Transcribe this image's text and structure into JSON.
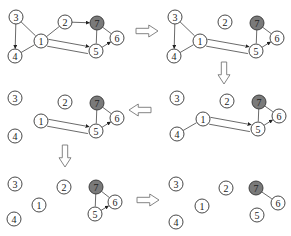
{
  "figure": {
    "node_radius": 7,
    "dark_node_color": "#7a7a7a",
    "panels": [
      {
        "id": "panel-1",
        "nodes": [
          {
            "id": "3",
            "x": 16,
            "y": 17
          },
          {
            "id": "4",
            "x": 15,
            "y": 56
          },
          {
            "id": "1",
            "x": 41,
            "y": 41
          },
          {
            "id": "2",
            "x": 65,
            "y": 22
          },
          {
            "id": "7",
            "x": 97,
            "y": 23,
            "dark": true
          },
          {
            "id": "5",
            "x": 96,
            "y": 51
          },
          {
            "id": "6",
            "x": 117,
            "y": 38
          }
        ],
        "edges": [
          {
            "from": "3",
            "to": "4",
            "arrow": true
          },
          {
            "from": "3",
            "to": "1"
          },
          {
            "from": "4",
            "to": "1"
          },
          {
            "from": "1",
            "to": "2"
          },
          {
            "from": "2",
            "to": "7",
            "arrow": true
          },
          {
            "from": "1",
            "to": "5",
            "arrow": true,
            "offset": -3
          },
          {
            "from": "1",
            "to": "5",
            "offset": 4
          },
          {
            "from": "7",
            "to": "5"
          },
          {
            "from": "7",
            "to": "6"
          },
          {
            "from": "5",
            "to": "6",
            "arrow": true
          }
        ]
      },
      {
        "id": "panel-2",
        "nodes": [
          {
            "id": "3",
            "x": 175,
            "y": 17
          },
          {
            "id": "4",
            "x": 174,
            "y": 56
          },
          {
            "id": "1",
            "x": 200,
            "y": 41
          },
          {
            "id": "2",
            "x": 225,
            "y": 22
          },
          {
            "id": "7",
            "x": 257,
            "y": 23,
            "dark": true
          },
          {
            "id": "5",
            "x": 256,
            "y": 51
          },
          {
            "id": "6",
            "x": 277,
            "y": 38
          }
        ],
        "edges": [
          {
            "from": "3",
            "to": "4",
            "arrow": true
          },
          {
            "from": "3",
            "to": "1"
          },
          {
            "from": "4",
            "to": "1"
          },
          {
            "from": "1",
            "to": "5",
            "arrow": true,
            "offset": -3
          },
          {
            "from": "1",
            "to": "5",
            "offset": 4
          },
          {
            "from": "7",
            "to": "5"
          },
          {
            "from": "7",
            "to": "6"
          },
          {
            "from": "5",
            "to": "6",
            "arrow": true
          }
        ]
      },
      {
        "id": "panel-3",
        "nodes": [
          {
            "id": "3",
            "x": 15,
            "y": 98
          },
          {
            "id": "4",
            "x": 15,
            "y": 136
          },
          {
            "id": "1",
            "x": 41,
            "y": 121
          },
          {
            "id": "2",
            "x": 65,
            "y": 102
          },
          {
            "id": "7",
            "x": 97,
            "y": 103,
            "dark": true
          },
          {
            "id": "5",
            "x": 96,
            "y": 131
          },
          {
            "id": "6",
            "x": 117,
            "y": 118
          }
        ],
        "edges": [
          {
            "from": "1",
            "to": "5",
            "arrow": true,
            "offset": -3
          },
          {
            "from": "1",
            "to": "5",
            "offset": 4
          },
          {
            "from": "7",
            "to": "5"
          },
          {
            "from": "7",
            "to": "6"
          },
          {
            "from": "5",
            "to": "6",
            "arrow": true
          }
        ]
      },
      {
        "id": "panel-4",
        "nodes": [
          {
            "id": "3",
            "x": 177,
            "y": 98
          },
          {
            "id": "4",
            "x": 177,
            "y": 134
          },
          {
            "id": "1",
            "x": 203,
            "y": 119
          },
          {
            "id": "2",
            "x": 227,
            "y": 101
          },
          {
            "id": "7",
            "x": 259,
            "y": 102,
            "dark": true
          },
          {
            "id": "5",
            "x": 258,
            "y": 129
          },
          {
            "id": "6",
            "x": 279,
            "y": 116
          }
        ],
        "edges": [
          {
            "from": "4",
            "to": "1"
          },
          {
            "from": "1",
            "to": "5",
            "arrow": true,
            "offset": -3
          },
          {
            "from": "1",
            "to": "5",
            "offset": 4
          },
          {
            "from": "7",
            "to": "5"
          },
          {
            "from": "7",
            "to": "6"
          },
          {
            "from": "5",
            "to": "6",
            "arrow": true
          }
        ]
      },
      {
        "id": "panel-5",
        "nodes": [
          {
            "id": "3",
            "x": 15,
            "y": 184
          },
          {
            "id": "4",
            "x": 14,
            "y": 219
          },
          {
            "id": "1",
            "x": 39,
            "y": 205
          },
          {
            "id": "2",
            "x": 64,
            "y": 187
          },
          {
            "id": "7",
            "x": 96,
            "y": 187,
            "dark": true
          },
          {
            "id": "5",
            "x": 95,
            "y": 214
          },
          {
            "id": "6",
            "x": 115,
            "y": 202
          }
        ],
        "edges": [
          {
            "from": "7",
            "to": "5"
          },
          {
            "from": "7",
            "to": "6"
          },
          {
            "from": "5",
            "to": "6",
            "arrow": true
          }
        ]
      },
      {
        "id": "panel-6",
        "nodes": [
          {
            "id": "3",
            "x": 176,
            "y": 184
          },
          {
            "id": "4",
            "x": 176,
            "y": 222
          },
          {
            "id": "1",
            "x": 202,
            "y": 206
          },
          {
            "id": "2",
            "x": 226,
            "y": 188
          },
          {
            "id": "7",
            "x": 256,
            "y": 188,
            "dark": true
          },
          {
            "id": "5",
            "x": 257,
            "y": 215
          },
          {
            "id": "6",
            "x": 278,
            "y": 203
          }
        ],
        "edges": [
          {
            "from": "7",
            "to": "6"
          }
        ]
      }
    ],
    "block_arrows": [
      {
        "name": "arrow-right-1",
        "dir": "right",
        "x": 136,
        "y": 31,
        "len": 22,
        "w": 12
      },
      {
        "name": "arrow-down-1",
        "dir": "down",
        "x": 224,
        "y": 62,
        "len": 22,
        "w": 12
      },
      {
        "name": "arrow-left-1",
        "dir": "left",
        "x": 151,
        "y": 110,
        "len": 22,
        "w": 12
      },
      {
        "name": "arrow-down-2",
        "dir": "down",
        "x": 65,
        "y": 145,
        "len": 22,
        "w": 12
      },
      {
        "name": "arrow-right-2",
        "dir": "right",
        "x": 137,
        "y": 200,
        "len": 22,
        "w": 12
      }
    ]
  }
}
